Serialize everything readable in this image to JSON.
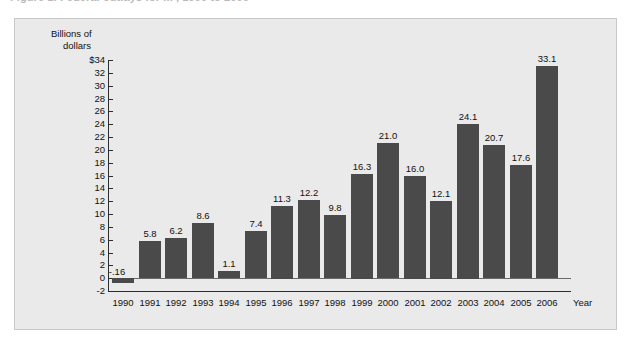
{
  "caption": {
    "text": "Figure 1.  Federal outlays for ... , 1990 to 2006"
  },
  "panel": {
    "background_color": "#eaeaea",
    "border_color": "#c8c8c8"
  },
  "axis": {
    "y_title_line1": "Billions of",
    "y_title_line2": "dollars",
    "x_title": "Year"
  },
  "chart_data": {
    "type": "bar",
    "title": "",
    "xlabel": "Year",
    "ylabel": "Billions of dollars",
    "categories": [
      "1990",
      "1991",
      "1992",
      "1993",
      "1994",
      "1996",
      "1996",
      "1997",
      "1998",
      "1999",
      "2000",
      "2001",
      "2002",
      "2003",
      "2004",
      "2005",
      "2006"
    ],
    "x": [
      "1990",
      "1991",
      "1992",
      "1993",
      "1994",
      "1995",
      "1996",
      "1997",
      "1998",
      "1999",
      "2000",
      "2001",
      "2002",
      "2003",
      "2004",
      "2005",
      "2006"
    ],
    "values": [
      -0.16,
      5.8,
      6.2,
      8.6,
      1.1,
      7.4,
      11.3,
      12.2,
      9.8,
      16.3,
      21.0,
      16.0,
      12.1,
      24.1,
      20.7,
      17.6,
      33.1
    ],
    "value_labels": [
      "-.16",
      "5.8",
      "6.2",
      "8.6",
      "1.1",
      "7.4",
      "11.3",
      "12.2",
      "9.8",
      "16.3",
      "21.0",
      "16.0",
      "12.1",
      "24.1",
      "20.7",
      "17.6",
      "33.1"
    ],
    "ylim": [
      -2,
      34
    ],
    "ytick_values": [
      34,
      32,
      30,
      28,
      26,
      24,
      22,
      20,
      18,
      16,
      14,
      12,
      10,
      8,
      6,
      4,
      2,
      0,
      -2
    ],
    "ytick_labels": [
      "$34",
      "32",
      "30",
      "28",
      "26",
      "24",
      "22",
      "20",
      "18",
      "16",
      "14",
      "12",
      "10",
      "8",
      "6",
      "4",
      "2",
      "0",
      "-2"
    ],
    "grid": false,
    "legend": null,
    "bar_color": "#4a4a4a",
    "series": [
      {
        "name": "Billions of dollars",
        "values": [
          -0.16,
          5.8,
          6.2,
          8.6,
          1.1,
          7.4,
          11.3,
          12.2,
          9.8,
          16.3,
          21.0,
          16.0,
          12.1,
          24.1,
          20.7,
          17.6,
          33.1
        ]
      }
    ]
  }
}
